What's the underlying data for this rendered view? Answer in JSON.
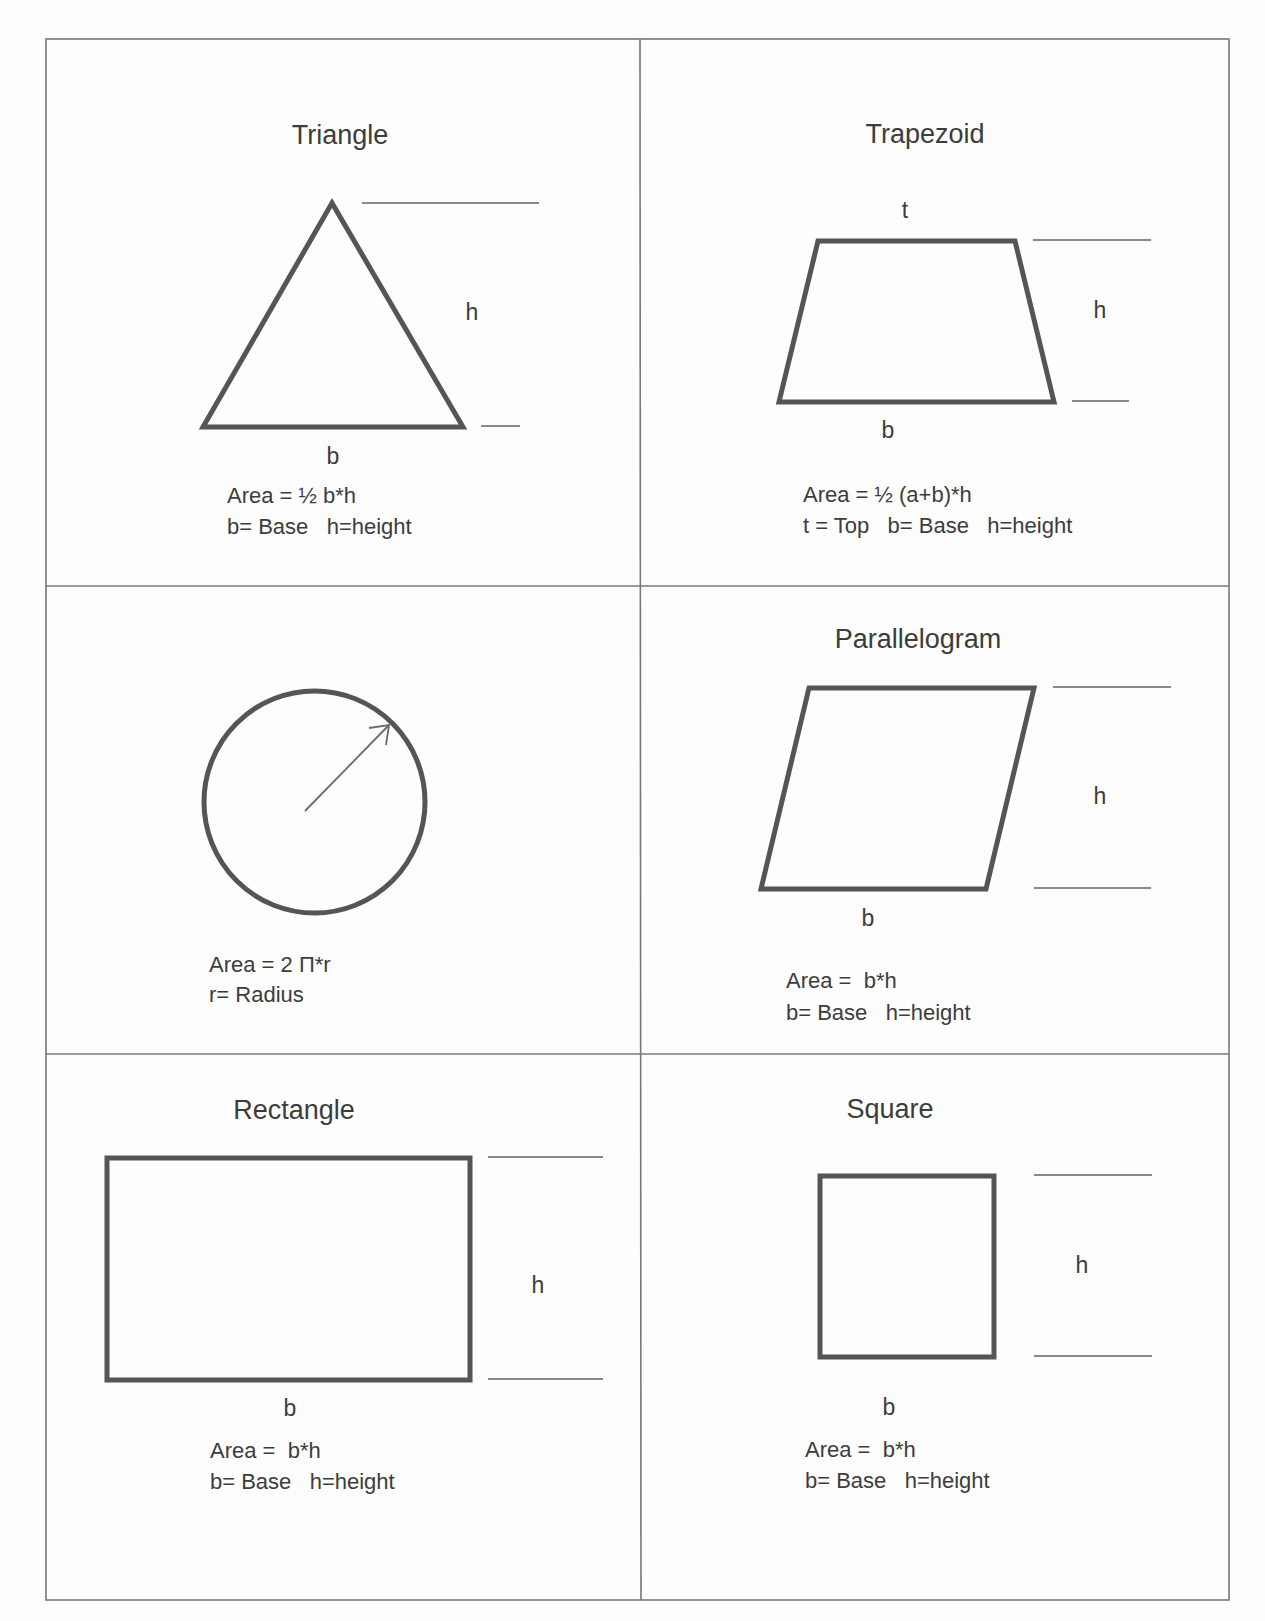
{
  "document": {
    "colors": {
      "background": "#fdfdfd",
      "shape_stroke": "#555555",
      "grid_stroke": "#777777",
      "dimension_line": "#8a8a8a",
      "text": "#3c3c3c"
    },
    "cells": [
      {
        "id": "triangle",
        "title": "Triangle",
        "labels": {
          "h": "h",
          "b": "b"
        },
        "formula": "Area = ½ b*h",
        "legend": "b= Base   h=height"
      },
      {
        "id": "trapezoid",
        "title": "Trapezoid",
        "labels": {
          "t": "t",
          "h": "h",
          "b": "b"
        },
        "formula": "Area = ½ (a+b)*h",
        "legend": "t = Top   b= Base   h=height"
      },
      {
        "id": "circle",
        "title": "",
        "labels": {},
        "formula": "Area = 2 Π*r",
        "legend": "r= Radius"
      },
      {
        "id": "parallelogram",
        "title": "Parallelogram",
        "labels": {
          "h": "h",
          "b": "b"
        },
        "formula": "Area =  b*h",
        "legend": "b= Base   h=height"
      },
      {
        "id": "rectangle",
        "title": "Rectangle",
        "labels": {
          "h": "h",
          "b": "b"
        },
        "formula": "Area =  b*h",
        "legend": "b= Base   h=height"
      },
      {
        "id": "square",
        "title": "Square",
        "labels": {
          "h": "h",
          "b": "b"
        },
        "formula": "Area =  b*h",
        "legend": "b= Base   h=height"
      }
    ]
  }
}
